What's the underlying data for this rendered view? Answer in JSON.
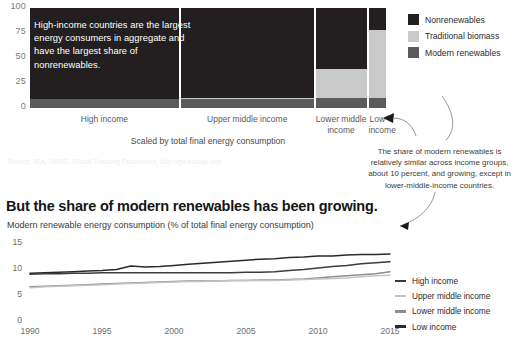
{
  "colors": {
    "nonrenewables": "#231f20",
    "traditional_biomass": "#c9c9c9",
    "modern_renewables": "#5b5b5b",
    "high_income_line": "#3c3c3c",
    "upper_middle_line": "#c3c3c3",
    "lower_middle_line": "#8e8e8e",
    "low_income_line": "#2a2a2a",
    "axis_text": "#6e6e6e",
    "source_text": "#eeeeee"
  },
  "top_chart": {
    "callout": "High-income countries are the largest energy consumers in aggregate and have the largest share of nonrenewables.",
    "scaled_note": "Scaled by total final energy consumption",
    "source": "Source: IEA, UNSD, Global Tracking Framework, http://gtf.esmap.org/",
    "legend": [
      {
        "label": "Nonrenewables",
        "color": "#231f20"
      },
      {
        "label": "Traditional biomass",
        "color": "#c9c9c9"
      },
      {
        "label": "Modern renewables",
        "color": "#5b5b5b"
      }
    ],
    "chart_data": {
      "type": "bar",
      "subtype": "marimekko-stacked-100pct",
      "title": "",
      "xlabel": "Scaled by total final energy consumption",
      "ylabel": "",
      "ylim": [
        0,
        100
      ],
      "yticks": [
        0,
        25,
        50,
        75,
        100
      ],
      "grid": false,
      "categories": [
        "High income",
        "Upper middle income",
        "Lower middle income",
        "Low income"
      ],
      "category_widths_pct": [
        42.5,
        38.0,
        14.5,
        5.0
      ],
      "series": [
        {
          "name": "Nonrenewables",
          "values": [
            91,
            90,
            61,
            22
          ]
        },
        {
          "name": "Traditional biomass",
          "values": [
            0,
            1,
            29,
            68
          ]
        },
        {
          "name": "Modern renewables",
          "values": [
            9,
            9,
            10,
            10
          ]
        }
      ]
    }
  },
  "annotation": {
    "text": "The share of modern renewables is relatively similar across income groups, about 10 percent, and growing, except in lower-middle-income countries."
  },
  "bottom_chart": {
    "headline": "But the share of modern renewables has been growing.",
    "subhead": "Modern renewable energy consumption (% of total final energy consumption)",
    "legend": [
      {
        "label": "High income",
        "color": "#3c3c3c"
      },
      {
        "label": "Upper middle income",
        "color": "#c3c3c3"
      },
      {
        "label": "Lower middle income",
        "color": "#8e8e8e"
      },
      {
        "label": "Low income",
        "color": "#2a2a2a"
      }
    ],
    "chart_data": {
      "type": "line",
      "title": "But the share of modern renewables has been growing.",
      "subtitle": "Modern renewable energy consumption (% of total final energy consumption)",
      "xlabel": "",
      "ylabel": "",
      "ylim": [
        0,
        15
      ],
      "yticks": [
        0,
        5,
        10,
        15
      ],
      "xlim": [
        1990,
        2015
      ],
      "xticks": [
        1990,
        1995,
        2000,
        2005,
        2010,
        2015
      ],
      "grid": false,
      "legend_position": "right",
      "x": [
        1990,
        1991,
        1992,
        1993,
        1994,
        1995,
        1996,
        1997,
        1998,
        1999,
        2000,
        2001,
        2002,
        2003,
        2004,
        2005,
        2006,
        2007,
        2008,
        2009,
        2010,
        2011,
        2012,
        2013,
        2014,
        2015
      ],
      "series": [
        {
          "name": "Low income",
          "color": "#2a2a2a",
          "values": [
            9.0,
            9.1,
            9.2,
            9.3,
            9.4,
            9.5,
            9.7,
            10.4,
            10.2,
            10.3,
            10.5,
            10.7,
            10.9,
            11.1,
            11.3,
            11.5,
            11.7,
            11.8,
            12.0,
            12.1,
            12.3,
            12.3,
            12.5,
            12.6,
            12.6,
            12.7
          ]
        },
        {
          "name": "High income",
          "color": "#3c3c3c",
          "values": [
            8.8,
            8.9,
            8.9,
            9.0,
            9.0,
            9.1,
            9.1,
            9.1,
            9.1,
            9.1,
            9.1,
            9.1,
            9.1,
            9.1,
            9.1,
            9.2,
            9.2,
            9.3,
            9.5,
            9.7,
            10.0,
            10.3,
            10.5,
            10.8,
            11.0,
            11.2
          ]
        },
        {
          "name": "Lower middle income",
          "color": "#8e8e8e",
          "values": [
            6.4,
            6.5,
            6.6,
            6.7,
            6.8,
            6.9,
            7.0,
            7.1,
            7.2,
            7.3,
            7.4,
            7.5,
            7.5,
            7.5,
            7.6,
            7.6,
            7.7,
            7.7,
            7.8,
            7.9,
            8.1,
            8.3,
            8.5,
            8.7,
            8.9,
            9.3
          ]
        },
        {
          "name": "Upper middle income",
          "color": "#c3c3c3",
          "values": [
            6.2,
            6.4,
            6.5,
            6.6,
            6.7,
            6.8,
            6.9,
            7.0,
            7.1,
            7.2,
            7.3,
            7.4,
            7.4,
            7.5,
            7.6,
            7.6,
            7.6,
            7.6,
            7.7,
            7.8,
            7.9,
            8.0,
            8.1,
            8.3,
            8.5,
            8.6
          ]
        }
      ]
    }
  }
}
